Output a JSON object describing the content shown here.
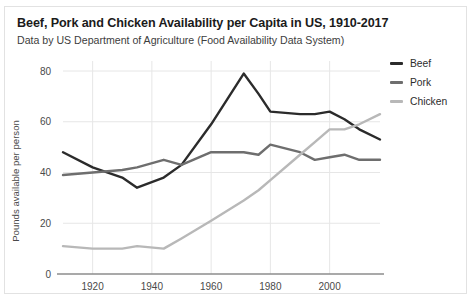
{
  "chart_data": {
    "type": "line",
    "title": "Beef, Pork and Chicken Availability per Capita in US, 1910-2017",
    "subtitle": "Data by US Department of Agriculture (Food Availability Data System)",
    "xlabel": "",
    "ylabel": "Pounds available per person",
    "xlim": [
      1910,
      2017
    ],
    "ylim": [
      0,
      80
    ],
    "grid": true,
    "legend_position": "right",
    "x_ticks": [
      1920,
      1940,
      1960,
      1980,
      2000
    ],
    "y_ticks": [
      0,
      20,
      40,
      60,
      80
    ],
    "x": [
      1910,
      1920,
      1930,
      1935,
      1944,
      1950,
      1960,
      1971,
      1976,
      1980,
      1990,
      1995,
      2000,
      2005,
      2010,
      2017
    ],
    "series": [
      {
        "name": "Beef",
        "color": "#2b2b2b",
        "values": [
          48,
          42,
          38,
          34,
          38,
          43,
          59,
          79,
          71,
          64,
          63,
          63,
          64,
          61,
          57,
          53
        ]
      },
      {
        "name": "Pork",
        "color": "#6e6e6e",
        "values": [
          39,
          40,
          41,
          42,
          45,
          43,
          48,
          48,
          47,
          51,
          48,
          45,
          46,
          47,
          45,
          45
        ]
      },
      {
        "name": "Chicken",
        "color": "#b8b8b8",
        "values": [
          11,
          10,
          10,
          11,
          10,
          14,
          21,
          29,
          33,
          37,
          47,
          52,
          57,
          57,
          59,
          63
        ]
      }
    ]
  },
  "legend": {
    "items": [
      {
        "label": "Beef"
      },
      {
        "label": "Pork"
      },
      {
        "label": "Chicken"
      }
    ]
  }
}
